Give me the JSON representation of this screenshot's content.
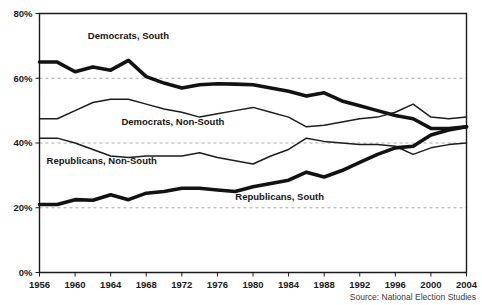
{
  "source_note": "Source: National Election Studies",
  "chart_data": {
    "type": "line",
    "title": "",
    "xlabel": "",
    "ylabel": "",
    "xlim": [
      1956,
      2004
    ],
    "ylim": [
      0,
      80
    ],
    "grid": true,
    "legend_position": "inline-labels",
    "x_tick_labels": [
      "1956",
      "1960",
      "1964",
      "1968",
      "1972",
      "1976",
      "1980",
      "1984",
      "1988",
      "1992",
      "1996",
      "2000",
      "2004"
    ],
    "x_ticks": [
      1956,
      1960,
      1964,
      1968,
      1972,
      1976,
      1980,
      1984,
      1988,
      1992,
      1996,
      2000,
      2004
    ],
    "y_tick_labels": [
      "0%",
      "20%",
      "40%",
      "60%",
      "80%"
    ],
    "y_ticks": [
      0,
      20,
      40,
      60,
      80
    ],
    "x": [
      1956,
      1958,
      1960,
      1962,
      1964,
      1966,
      1968,
      1970,
      1972,
      1974,
      1976,
      1978,
      1980,
      1982,
      1984,
      1986,
      1988,
      1990,
      1992,
      1994,
      1996,
      1998,
      2000,
      2002,
      2004
    ],
    "series": [
      {
        "name": "Democrats, South",
        "style": "thick",
        "label": "Democrats, South",
        "label_x": 1966,
        "label_y": 72,
        "values": [
          65.0,
          65.0,
          62.0,
          63.5,
          62.5,
          65.5,
          60.5,
          58.5,
          57.0,
          58.0,
          58.3,
          58.2,
          58.0,
          57.0,
          56.0,
          54.5,
          55.5,
          53.0,
          51.5,
          50.0,
          48.5,
          47.5,
          44.5,
          44.5,
          45.0
        ]
      },
      {
        "name": "Democrats, Non-South",
        "style": "thin",
        "label": "Democrats, Non-South",
        "label_x": 1971,
        "label_y": 45.5,
        "values": [
          47.5,
          47.5,
          50.0,
          52.5,
          53.5,
          53.5,
          52.0,
          50.5,
          49.5,
          48.0,
          49.0,
          50.0,
          51.0,
          49.5,
          48.0,
          45.0,
          45.5,
          46.5,
          47.5,
          48.0,
          49.5,
          52.0,
          48.0,
          47.5,
          48.0
        ]
      },
      {
        "name": "Republicans, Non-South",
        "style": "thin",
        "label": "Republicans, Non-South",
        "label_x": 1963,
        "label_y": 33.5,
        "values": [
          41.5,
          41.5,
          40.0,
          38.0,
          36.0,
          35.5,
          36.0,
          36.0,
          36.0,
          37.0,
          35.5,
          34.5,
          33.5,
          36.0,
          38.0,
          41.5,
          40.5,
          40.0,
          39.5,
          39.5,
          39.0,
          36.5,
          38.5,
          39.5,
          40.0
        ]
      },
      {
        "name": "Republicans, South",
        "style": "thick",
        "label": "Republicans, South",
        "label_x": 1983,
        "label_y": 22.5,
        "values": [
          21.0,
          21.0,
          22.5,
          22.3,
          24.0,
          22.5,
          24.5,
          25.0,
          26.0,
          26.0,
          25.5,
          25.0,
          26.5,
          27.5,
          28.5,
          31.0,
          29.5,
          31.5,
          34.0,
          36.5,
          38.5,
          39.0,
          42.5,
          44.0,
          45.0
        ]
      }
    ]
  }
}
